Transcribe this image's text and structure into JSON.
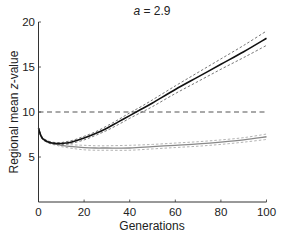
{
  "chart_data": {
    "type": "line",
    "title": "a = 2.9",
    "title_italic_part": "a",
    "title_rest": " = 2.9",
    "xlabel": "Generations",
    "ylabel": "Regional mean z-value",
    "ylabel_italic_part": "z",
    "xlim": [
      0,
      100
    ],
    "ylim": [
      0,
      20
    ],
    "xticks": [
      0,
      20,
      40,
      60,
      80,
      100
    ],
    "yticks": [
      5,
      10,
      15,
      20
    ],
    "grid": false,
    "legend": null,
    "threshold": {
      "y": 10,
      "style": "dashed",
      "color": "#555555"
    },
    "series": [
      {
        "name": "black-mean",
        "color": "#111111",
        "style": "solid",
        "x": [
          0,
          1,
          2,
          4,
          6,
          8,
          10,
          12,
          15,
          20,
          25,
          30,
          35,
          40,
          45,
          50,
          60,
          70,
          80,
          90,
          100
        ],
        "values": [
          8.2,
          7.4,
          7.0,
          6.7,
          6.55,
          6.5,
          6.5,
          6.55,
          6.7,
          7.1,
          7.6,
          8.2,
          8.9,
          9.6,
          10.3,
          11.0,
          12.5,
          13.9,
          15.3,
          16.7,
          18.2
        ]
      },
      {
        "name": "black-upper",
        "color": "#666666",
        "style": "dashed",
        "x": [
          0,
          1,
          2,
          4,
          6,
          8,
          10,
          12,
          15,
          20,
          25,
          30,
          35,
          40,
          45,
          50,
          60,
          70,
          80,
          90,
          100
        ],
        "values": [
          8.3,
          7.5,
          7.1,
          6.8,
          6.65,
          6.6,
          6.6,
          6.7,
          6.85,
          7.3,
          7.8,
          8.45,
          9.15,
          9.9,
          10.6,
          11.35,
          12.9,
          14.4,
          15.9,
          17.4,
          19.0
        ]
      },
      {
        "name": "black-lower",
        "color": "#666666",
        "style": "dashed",
        "x": [
          0,
          1,
          2,
          4,
          6,
          8,
          10,
          12,
          15,
          20,
          25,
          30,
          35,
          40,
          45,
          50,
          60,
          70,
          80,
          90,
          100
        ],
        "values": [
          8.1,
          7.3,
          6.9,
          6.6,
          6.45,
          6.4,
          6.4,
          6.45,
          6.55,
          6.9,
          7.4,
          7.95,
          8.6,
          9.3,
          9.95,
          10.6,
          12.05,
          13.4,
          14.75,
          16.05,
          17.4
        ]
      },
      {
        "name": "gray-mean",
        "color": "#888888",
        "style": "solid",
        "x": [
          0,
          1,
          2,
          4,
          6,
          8,
          10,
          15,
          20,
          25,
          30,
          40,
          50,
          60,
          70,
          80,
          90,
          100
        ],
        "values": [
          8.2,
          7.4,
          7.0,
          6.7,
          6.5,
          6.4,
          6.3,
          6.15,
          6.05,
          6.0,
          6.0,
          6.0,
          6.15,
          6.3,
          6.45,
          6.65,
          6.9,
          7.25
        ]
      },
      {
        "name": "gray-upper",
        "color": "#aaaaaa",
        "style": "dashed",
        "x": [
          0,
          1,
          2,
          4,
          6,
          8,
          10,
          15,
          20,
          25,
          30,
          40,
          50,
          60,
          70,
          80,
          90,
          100
        ],
        "values": [
          8.3,
          7.5,
          7.1,
          6.8,
          6.6,
          6.5,
          6.45,
          6.35,
          6.3,
          6.25,
          6.25,
          6.3,
          6.4,
          6.55,
          6.7,
          6.9,
          7.15,
          7.55
        ]
      },
      {
        "name": "gray-lower",
        "color": "#aaaaaa",
        "style": "dashed",
        "x": [
          0,
          1,
          2,
          4,
          6,
          8,
          10,
          15,
          20,
          25,
          30,
          40,
          50,
          60,
          70,
          80,
          90,
          100
        ],
        "values": [
          8.1,
          7.3,
          6.9,
          6.6,
          6.4,
          6.3,
          6.15,
          5.95,
          5.8,
          5.75,
          5.75,
          5.75,
          5.9,
          6.05,
          6.2,
          6.4,
          6.65,
          6.95
        ]
      }
    ]
  }
}
